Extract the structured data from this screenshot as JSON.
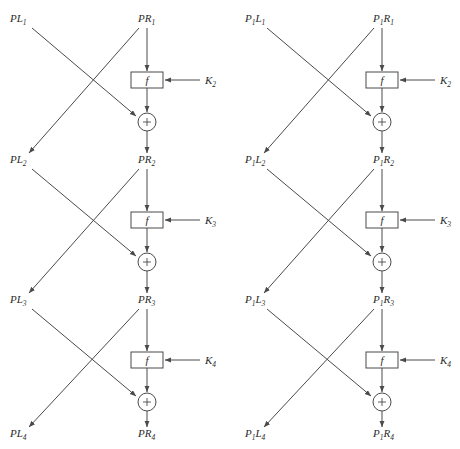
{
  "figure": {
    "colors": {
      "stroke": "#4a4a4a",
      "text": "#2b2b2b",
      "background": "#ffffff"
    },
    "function_box_label": "f",
    "xor_symbol": "+"
  },
  "diagrams": [
    {
      "id": "left",
      "x_offset": 0,
      "left_labels": [
        {
          "base": "PL",
          "sub": "1"
        },
        {
          "base": "PL",
          "sub": "2"
        },
        {
          "base": "PL",
          "sub": "3"
        },
        {
          "base": "PL",
          "sub": "4"
        }
      ],
      "right_labels": [
        {
          "base": "PR",
          "sub": "1"
        },
        {
          "base": "PR",
          "sub": "2"
        },
        {
          "base": "PR",
          "sub": "3"
        },
        {
          "base": "PR",
          "sub": "4"
        }
      ],
      "key_labels": [
        {
          "base": "K",
          "sub": "2"
        },
        {
          "base": "K",
          "sub": "3"
        },
        {
          "base": "K",
          "sub": "4"
        }
      ],
      "function_labels": [
        "f",
        "f",
        "f"
      ]
    },
    {
      "id": "right",
      "x_offset": 235,
      "left_labels": [
        {
          "base": "P",
          "sub": "1",
          "base2": "L",
          "sub2": "1"
        },
        {
          "base": "P",
          "sub": "1",
          "base2": "L",
          "sub2": "2"
        },
        {
          "base": "P",
          "sub": "1",
          "base2": "L",
          "sub2": "3"
        },
        {
          "base": "P",
          "sub": "1",
          "base2": "L",
          "sub2": "4"
        }
      ],
      "right_labels": [
        {
          "base": "P",
          "sub": "1",
          "base2": "R",
          "sub2": "1"
        },
        {
          "base": "P",
          "sub": "1",
          "base2": "R",
          "sub2": "2"
        },
        {
          "base": "P",
          "sub": "1",
          "base2": "R",
          "sub2": "3"
        },
        {
          "base": "P",
          "sub": "1",
          "base2": "R",
          "sub2": "4"
        }
      ],
      "key_labels": [
        {
          "base": "K",
          "sub": "2"
        },
        {
          "base": "K",
          "sub": "3"
        },
        {
          "base": "K",
          "sub": "4"
        }
      ],
      "function_labels": [
        "f",
        "f",
        "f"
      ]
    }
  ],
  "geometry": {
    "rounds": 3,
    "row_label_y": [
      22,
      163,
      303,
      437
    ],
    "fbox": {
      "width": 32,
      "height": 16,
      "x": 131,
      "y_top": [
        72,
        212,
        352
      ]
    },
    "xor": {
      "cx": 147,
      "cy": [
        122,
        262,
        402
      ],
      "r": 9
    },
    "left_col_x": 24,
    "right_col_x": 147,
    "key_x": 205,
    "key_line_start_x": 200
  }
}
